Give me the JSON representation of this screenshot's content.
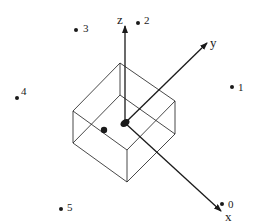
{
  "diagram": {
    "colors": {
      "ink": "#1a1a1a",
      "background": "#ffffff"
    },
    "axes": {
      "z": {
        "label": "z"
      },
      "y": {
        "label": "y"
      },
      "x": {
        "label": "x"
      }
    },
    "points": [
      {
        "label": "0"
      },
      {
        "label": "1"
      },
      {
        "label": "2"
      },
      {
        "label": "3"
      },
      {
        "label": "4"
      },
      {
        "label": "5"
      }
    ]
  }
}
